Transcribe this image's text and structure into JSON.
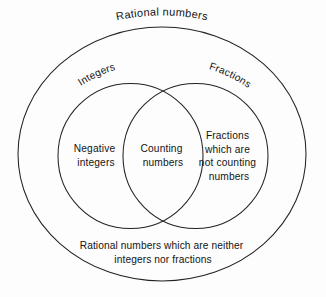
{
  "figure": {
    "type": "venn-diagram",
    "title": "Rational numbers",
    "background_color": "#fdfdfd",
    "stroke_color": "#232323",
    "text_color": "#141414"
  },
  "sets": {
    "outer": {
      "name": "Rational numbers",
      "label": "Rational numbers",
      "shape": "ellipse"
    },
    "left": {
      "name": "Integers",
      "label": "Integers",
      "shape": "circle"
    },
    "right": {
      "name": "Fractions",
      "label": "Fractions",
      "shape": "circle"
    }
  },
  "regions": {
    "left_only": {
      "lines": [
        "Negative",
        "integers"
      ]
    },
    "intersection": {
      "lines": [
        "Counting",
        "numbers"
      ]
    },
    "right_only": {
      "lines": [
        "Fractions",
        "which are",
        "not counting",
        "numbers"
      ]
    },
    "outside_circles": {
      "lines": [
        "Rational numbers which are neither",
        "integers nor fractions"
      ]
    }
  }
}
